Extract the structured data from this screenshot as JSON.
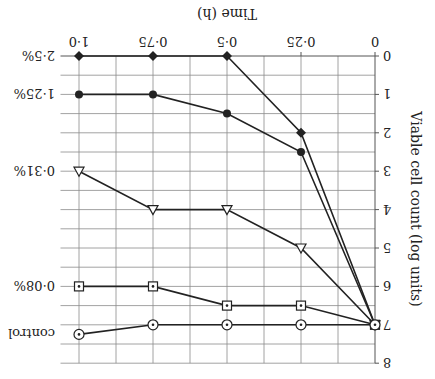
{
  "chart_data": {
    "type": "line",
    "orientation_note_visible": "figure rendered upside-down (rotated 180°)",
    "title": "",
    "xlabel": "Time (h)",
    "ylabel": "Viable cell count (log units)",
    "x": [
      0,
      0.25,
      0.5,
      0.75,
      1.0
    ],
    "x_tick_labels": [
      "0",
      "0·25",
      "0·5",
      "0·75",
      "1·0"
    ],
    "y_ticks": [
      0,
      1,
      2,
      3,
      4,
      5,
      6,
      7,
      8
    ],
    "y_tick_labels": [
      "0",
      "1",
      "2",
      "3",
      "4",
      "5",
      "6",
      "7",
      "8"
    ],
    "xlim": [
      0,
      1.0625
    ],
    "ylim": [
      0,
      8
    ],
    "grid": true,
    "legend_position": "series labels at line ends (right side)",
    "series": [
      {
        "name": "2·5%",
        "marker": "filled-diamond",
        "values": [
          7,
          2,
          0,
          0,
          0
        ]
      },
      {
        "name": "1·25%",
        "marker": "filled-circle",
        "values": [
          7,
          2.5,
          1.5,
          1,
          1
        ]
      },
      {
        "name": "0·31%",
        "marker": "open-triangle-down",
        "values": [
          7,
          5,
          4,
          4,
          3
        ]
      },
      {
        "name": "0·08%",
        "marker": "dotted-square",
        "values": [
          7,
          6.5,
          6.5,
          6,
          6
        ]
      },
      {
        "name": "control",
        "marker": "dotted-circle",
        "values": [
          7,
          7,
          7,
          7,
          7.25
        ]
      }
    ]
  },
  "colors": {
    "line": "#222222",
    "grid": "#8a8a8a",
    "background": "#ffffff"
  }
}
